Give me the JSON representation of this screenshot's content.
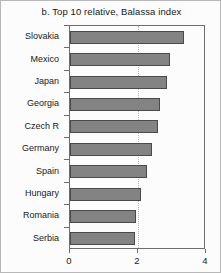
{
  "figure": {
    "title": "b. Top 10 relative, Balassa index",
    "border_color": "#b8b8b8",
    "background": "#fcfcfc"
  },
  "chart_data": {
    "type": "bar",
    "orientation": "horizontal",
    "title": "b. Top 10 relative, Balassa index",
    "xlabel": "",
    "ylabel": "",
    "categories": [
      "Slovakia",
      "Mexico",
      "Japan",
      "Georgia",
      "Czech R",
      "Germany",
      "Spain",
      "Hungary",
      "Romania",
      "Serbia"
    ],
    "values": [
      3.35,
      2.95,
      2.85,
      2.65,
      2.6,
      2.4,
      2.25,
      2.1,
      1.95,
      1.92
    ],
    "xlim": [
      0,
      4
    ],
    "xticks": [
      0,
      2,
      4
    ],
    "xtick_labels": [
      "0",
      "2",
      "4"
    ],
    "grid": "vertical-dotted-at-2",
    "legend": null,
    "bar_fill": "#838383",
    "bar_edge": "#4a4a4a"
  }
}
